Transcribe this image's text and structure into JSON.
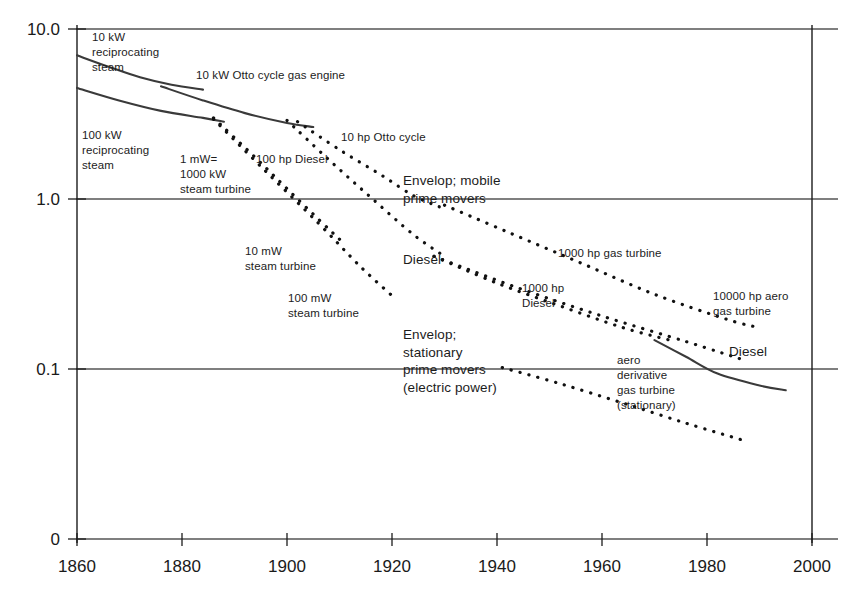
{
  "chart_data": {
    "type": "line",
    "title": "",
    "subtitle": "",
    "xlabel": "",
    "ylabel": "",
    "xlim": [
      1860,
      2000
    ],
    "ylim": [
      0.1,
      10.0
    ],
    "yscale": "log",
    "xscale": "linear",
    "grid": "horizontal gridlines at 10.0, 1.0, 0.1 and baseline 0",
    "legend": "none (inline curve labels)",
    "x_ticks": [
      "1860",
      "1880",
      "1900",
      "1920",
      "1940",
      "1960",
      "1980",
      "2000"
    ],
    "y_ticks": [
      "10.0",
      "1.0",
      "0.1",
      "0"
    ],
    "series": [
      {
        "name": "10 kW reciprocating steam",
        "style": "solid",
        "points": [
          [
            1860,
            7.0
          ],
          [
            1866,
            6.0
          ],
          [
            1872,
            5.2
          ],
          [
            1878,
            4.7
          ],
          [
            1884,
            4.4
          ]
        ]
      },
      {
        "name": "100 kW reciprocating steam",
        "style": "solid",
        "points": [
          [
            1860,
            4.5
          ],
          [
            1868,
            3.8
          ],
          [
            1876,
            3.3
          ],
          [
            1884,
            3.0
          ],
          [
            1888,
            2.85
          ]
        ]
      },
      {
        "name": "10 kW Otto cycle gas engine",
        "style": "solid",
        "points": [
          [
            1876,
            4.6
          ],
          [
            1884,
            3.8
          ],
          [
            1892,
            3.2
          ],
          [
            1900,
            2.8
          ],
          [
            1905,
            2.65
          ]
        ]
      },
      {
        "name": "1 mW= 1000 kW steam turbine",
        "style": "dotted",
        "points": [
          [
            1886,
            3.0
          ],
          [
            1894,
            1.75
          ],
          [
            1900,
            1.15
          ],
          [
            1906,
            0.76
          ],
          [
            1910,
            0.58
          ]
        ]
      },
      {
        "name": "100 hp Diesel",
        "style": "dotted",
        "points": [
          [
            1900,
            2.9
          ],
          [
            1908,
            1.7
          ],
          [
            1916,
            1.02
          ],
          [
            1924,
            0.62
          ],
          [
            1930,
            0.46
          ]
        ]
      },
      {
        "name": "10 hp Otto cycle",
        "style": "dotted",
        "points": [
          [
            1902,
            2.85
          ],
          [
            1910,
            1.95
          ],
          [
            1918,
            1.38
          ],
          [
            1924,
            1.05
          ],
          [
            1929,
            0.9
          ]
        ]
      },
      {
        "name": "10 mW steam turbine",
        "style": "dotted",
        "points": [
          [
            1886,
            2.95
          ],
          [
            1896,
            1.45
          ],
          [
            1906,
            0.72
          ],
          [
            1914,
            0.4
          ],
          [
            1920,
            0.27
          ]
        ]
      },
      {
        "name": "Diesel (mid)",
        "style": "dotted",
        "points": [
          [
            1928,
            0.46
          ],
          [
            1940,
            0.32
          ],
          [
            1952,
            0.235
          ],
          [
            1964,
            0.175
          ],
          [
            1974,
            0.145
          ]
        ]
      },
      {
        "name": "1000 hp gas turbine / Envelop; mobile prime movers",
        "style": "dotted",
        "points": [
          [
            1930,
            0.92
          ],
          [
            1942,
            0.64
          ],
          [
            1956,
            0.42
          ],
          [
            1970,
            0.275
          ],
          [
            1984,
            0.195
          ],
          [
            1990,
            0.175
          ]
        ]
      },
      {
        "name": "1000 hp Diesel / 10000 hp aero gas turbine",
        "style": "dotted",
        "points": [
          [
            1928,
            0.46
          ],
          [
            1944,
            0.3
          ],
          [
            1960,
            0.205
          ],
          [
            1976,
            0.145
          ],
          [
            1987,
            0.113
          ]
        ]
      },
      {
        "name": "aero derivative gas turbine (stationary)",
        "style": "solid",
        "points": [
          [
            1970,
            0.148
          ],
          [
            1976,
            0.118
          ],
          [
            1982,
            0.094
          ],
          [
            1990,
            0.08
          ],
          [
            1995,
            0.075
          ]
        ]
      },
      {
        "name": "Envelop; stationary prime movers (electric power)",
        "style": "dotted",
        "points": [
          [
            1941,
            0.102
          ],
          [
            1952,
            0.082
          ],
          [
            1964,
            0.063
          ],
          [
            1976,
            0.048
          ],
          [
            1987,
            0.038
          ]
        ]
      }
    ],
    "annotations": [
      {
        "id": "ann-10kw-recip-steam",
        "text": "10 kW\nreciprocating\nsteam",
        "size": "sm"
      },
      {
        "id": "ann-100kw-recip-steam",
        "text": "100 kW\nreciprocating\nsteam",
        "size": "sm"
      },
      {
        "id": "ann-10kw-otto-gas-engine",
        "text": "10 kW Otto cycle gas engine",
        "size": "sm"
      },
      {
        "id": "ann-1mw-steam-turbine",
        "text": "1 mW=\n1000 kW\nsteam turbine",
        "size": "sm"
      },
      {
        "id": "ann-100hp-diesel",
        "text": "100 hp Diesel",
        "size": "sm"
      },
      {
        "id": "ann-10hp-otto-cycle",
        "text": "10 hp Otto cycle",
        "size": "sm"
      },
      {
        "id": "ann-envelop-mobile",
        "text": "Envelop; mobile\nprime movers",
        "size": "md"
      },
      {
        "id": "ann-10mw-steam-turbine",
        "text": "10 mW\nsteam turbine",
        "size": "sm"
      },
      {
        "id": "ann-100mw-steam-turbine",
        "text": "100 mW\nsteam turbine",
        "size": "sm"
      },
      {
        "id": "ann-diesel-mid",
        "text": "Diesel",
        "size": "md"
      },
      {
        "id": "ann-1000hp-gas-turbine",
        "text": "1000 hp gas turbine",
        "size": "sm"
      },
      {
        "id": "ann-1000hp-diesel",
        "text": "1000 hp\nDiesel",
        "size": "sm"
      },
      {
        "id": "ann-10000hp-aero-gas-turbine",
        "text": "10000 hp aero\ngas turbine",
        "size": "sm"
      },
      {
        "id": "ann-envelop-stationary",
        "text": "Envelop;\nstationary\nprime movers\n(electric power)",
        "size": "md"
      },
      {
        "id": "ann-aero-derivative",
        "text": "aero\nderivative\ngas turbine\n(stationary)",
        "size": "sm"
      },
      {
        "id": "ann-diesel-right",
        "text": "Diesel",
        "size": "md"
      }
    ]
  },
  "axis": {
    "y_labels": [
      "10.0",
      "1.0",
      "0.1",
      "0"
    ],
    "x_labels": [
      "1860",
      "1880",
      "1900",
      "1920",
      "1940",
      "1960",
      "1980",
      "2000"
    ]
  }
}
